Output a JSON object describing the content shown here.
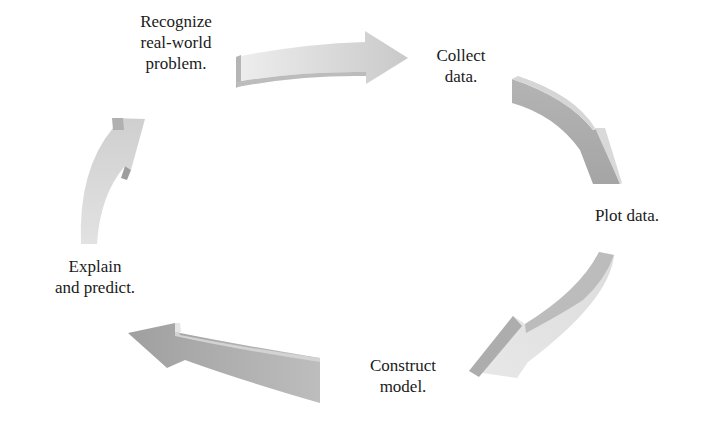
{
  "diagram": {
    "type": "cycle",
    "direction": "clockwise",
    "steps": [
      {
        "id": "recognize",
        "lines": [
          "Recognize",
          "real-world",
          "problem."
        ]
      },
      {
        "id": "collect",
        "lines": [
          "Collect",
          "data."
        ]
      },
      {
        "id": "plot",
        "lines": [
          "Plot data."
        ]
      },
      {
        "id": "construct",
        "lines": [
          "Construct",
          "model."
        ]
      },
      {
        "id": "explain",
        "lines": [
          "Explain",
          "and predict."
        ]
      }
    ],
    "arrows": [
      {
        "from": "recognize",
        "to": "collect"
      },
      {
        "from": "collect",
        "to": "plot"
      },
      {
        "from": "plot",
        "to": "construct"
      },
      {
        "from": "construct",
        "to": "explain"
      },
      {
        "from": "explain",
        "to": "recognize"
      }
    ],
    "colors": {
      "text": "#1a1a1a",
      "arrow_light": "#e2e2e2",
      "arrow_mid": "#c8c8c8",
      "arrow_dark": "#a9a9a9",
      "background": "#ffffff"
    }
  }
}
